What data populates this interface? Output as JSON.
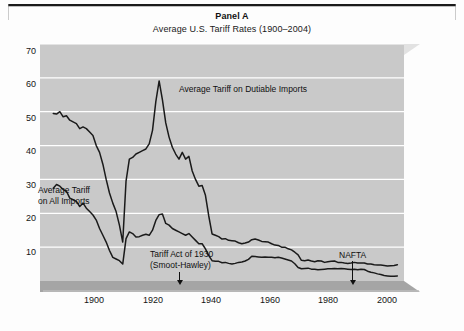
{
  "figure": {
    "title": "Panel A",
    "subtitle": "Average U.S. Tariff Rates (1900–2004)"
  },
  "chart_data": {
    "type": "line",
    "title": "Panel A",
    "subtitle": "Average U.S. Tariff Rates (1900–2004)",
    "xlabel": "",
    "ylabel": "",
    "xlim": [
      1896,
      2006
    ],
    "ylim": [
      0,
      70
    ],
    "xticks": [
      1900,
      1920,
      1940,
      1960,
      1980,
      2000
    ],
    "yticks": [
      10,
      20,
      30,
      40,
      50,
      60,
      70
    ],
    "grid": "horizontal",
    "grid_color": "#ffffff",
    "plot_background": "#c9c9c9",
    "line_color": "#1a1a1a",
    "legend": "none (inline series labels)",
    "annotations": [
      {
        "text": "Average Tariff on Dutiable Imports",
        "x": 1936,
        "y": 54,
        "arrow": false
      },
      {
        "text": "Average Tariff\non All Imports",
        "x": 1899,
        "y": 25,
        "arrow": false
      },
      {
        "text": "Tariff Act of 1930\n(Smoot-Hawley)",
        "x": 1930,
        "y": 6,
        "arrow": true,
        "arrow_to_year": 1930
      },
      {
        "text": "NAFTA",
        "x": 1994,
        "y": 6,
        "arrow": true,
        "arrow_to_year": 1994
      }
    ],
    "series": [
      {
        "name": "Average Tariff on Dutiable Imports",
        "x": [
          1900,
          1901,
          1902,
          1903,
          1904,
          1905,
          1906,
          1907,
          1908,
          1909,
          1910,
          1911,
          1912,
          1913,
          1914,
          1915,
          1916,
          1917,
          1918,
          1919,
          1920,
          1921,
          1922,
          1923,
          1924,
          1925,
          1926,
          1927,
          1928,
          1929,
          1930,
          1931,
          1932,
          1933,
          1934,
          1935,
          1936,
          1937,
          1938,
          1939,
          1940,
          1941,
          1942,
          1943,
          1944,
          1945,
          1946,
          1947,
          1948,
          1949,
          1950,
          1951,
          1952,
          1953,
          1954,
          1955,
          1956,
          1957,
          1958,
          1959,
          1960,
          1961,
          1962,
          1963,
          1964,
          1965,
          1966,
          1967,
          1968,
          1969,
          1970,
          1971,
          1972,
          1973,
          1974,
          1975,
          1976,
          1977,
          1978,
          1979,
          1980,
          1981,
          1982,
          1983,
          1984,
          1985,
          1986,
          1987,
          1988,
          1989,
          1990,
          1991,
          1992,
          1993,
          1994,
          1995,
          1996,
          1997,
          1998,
          1999,
          2000,
          2001,
          2002,
          2003,
          2004
        ],
        "y": [
          49.5,
          49.3,
          50.0,
          48.5,
          48.8,
          47.5,
          47.0,
          46.5,
          45.0,
          45.5,
          45.0,
          44.0,
          43.0,
          40.0,
          38.0,
          34.5,
          30.0,
          26.0,
          23.0,
          20.5,
          16.5,
          11.5,
          29.5,
          36.0,
          36.5,
          37.5,
          38.0,
          38.5,
          39.0,
          40.5,
          44.5,
          53.0,
          59.1,
          53.5,
          46.7,
          42.5,
          39.5,
          37.5,
          36.0,
          38.0,
          36.0,
          36.8,
          32.5,
          30.0,
          28.0,
          28.2,
          25.3,
          19.2,
          13.9,
          13.5,
          13.1,
          12.4,
          12.5,
          12.0,
          11.9,
          11.8,
          11.3,
          11.0,
          11.2,
          11.5,
          12.2,
          12.4,
          12.1,
          11.7,
          11.6,
          11.5,
          11.0,
          10.6,
          10.5,
          10.0,
          10.0,
          9.5,
          9.2,
          8.5,
          7.7,
          6.1,
          6.0,
          6.2,
          5.9,
          5.7,
          6.0,
          5.9,
          5.5,
          5.7,
          5.8,
          5.9,
          5.5,
          5.5,
          5.3,
          5.2,
          5.3,
          5.5,
          5.3,
          5.3,
          5.3,
          5.0,
          5.0,
          4.8,
          4.7,
          4.7,
          4.6,
          4.4,
          4.5,
          4.6,
          4.8
        ]
      },
      {
        "name": "Average Tariff on All Imports",
        "x": [
          1900,
          1901,
          1902,
          1903,
          1904,
          1905,
          1906,
          1907,
          1908,
          1909,
          1910,
          1911,
          1912,
          1913,
          1914,
          1915,
          1916,
          1917,
          1918,
          1919,
          1920,
          1921,
          1922,
          1923,
          1924,
          1925,
          1926,
          1927,
          1928,
          1929,
          1930,
          1931,
          1932,
          1933,
          1934,
          1935,
          1936,
          1937,
          1938,
          1939,
          1940,
          1941,
          1942,
          1943,
          1944,
          1945,
          1946,
          1947,
          1948,
          1949,
          1950,
          1951,
          1952,
          1953,
          1954,
          1955,
          1956,
          1957,
          1958,
          1959,
          1960,
          1961,
          1962,
          1963,
          1964,
          1965,
          1966,
          1967,
          1968,
          1969,
          1970,
          1971,
          1972,
          1973,
          1974,
          1975,
          1976,
          1977,
          1978,
          1979,
          1980,
          1981,
          1982,
          1983,
          1984,
          1985,
          1986,
          1987,
          1988,
          1989,
          1990,
          1991,
          1992,
          1993,
          1994,
          1995,
          1996,
          1997,
          1998,
          1999,
          2000,
          2001,
          2002,
          2003,
          2004
        ],
        "y": [
          27.4,
          28.5,
          28.0,
          27.0,
          26.5,
          24.5,
          24.0,
          23.5,
          22.0,
          23.0,
          21.5,
          20.5,
          19.5,
          18.0,
          15.5,
          13.5,
          11.5,
          9.0,
          7.0,
          6.5,
          6.0,
          5.0,
          12.5,
          14.5,
          14.0,
          13.0,
          13.1,
          13.5,
          13.8,
          13.5,
          15.0,
          17.9,
          19.6,
          19.8,
          17.0,
          16.5,
          15.5,
          15.0,
          14.5,
          14.0,
          13.5,
          14.0,
          13.0,
          12.0,
          11.0,
          11.0,
          9.5,
          7.5,
          6.0,
          5.8,
          5.8,
          5.4,
          5.5,
          5.2,
          5.0,
          5.2,
          5.5,
          5.6,
          5.9,
          6.4,
          7.3,
          7.2,
          7.1,
          7.0,
          7.1,
          7.0,
          7.0,
          6.9,
          7.0,
          6.8,
          6.5,
          6.2,
          5.9,
          5.1,
          4.0,
          3.6,
          3.7,
          3.8,
          3.5,
          3.5,
          3.3,
          3.4,
          3.5,
          3.6,
          3.6,
          3.7,
          3.6,
          3.7,
          3.6,
          3.5,
          3.4,
          3.5,
          3.3,
          3.5,
          3.4,
          2.9,
          2.6,
          2.4,
          2.1,
          1.9,
          1.6,
          1.5,
          1.4,
          1.4,
          1.5
        ]
      }
    ]
  },
  "axes": {
    "y_ticks": [
      "70",
      "60",
      "50",
      "40",
      "30",
      "20",
      "10"
    ],
    "x_ticks": [
      "1900",
      "1920",
      "1940",
      "1960",
      "1980",
      "2000"
    ]
  },
  "annotations": {
    "dutiable_label": "Average Tariff on Dutiable Imports",
    "all_imports_label_line1": "Average Tariff",
    "all_imports_label_line2": "on All Imports",
    "tariff_act_line1": "Tariff Act of 1930",
    "tariff_act_line2": "(Smoot-Hawley)",
    "nafta_label": "NAFTA"
  }
}
